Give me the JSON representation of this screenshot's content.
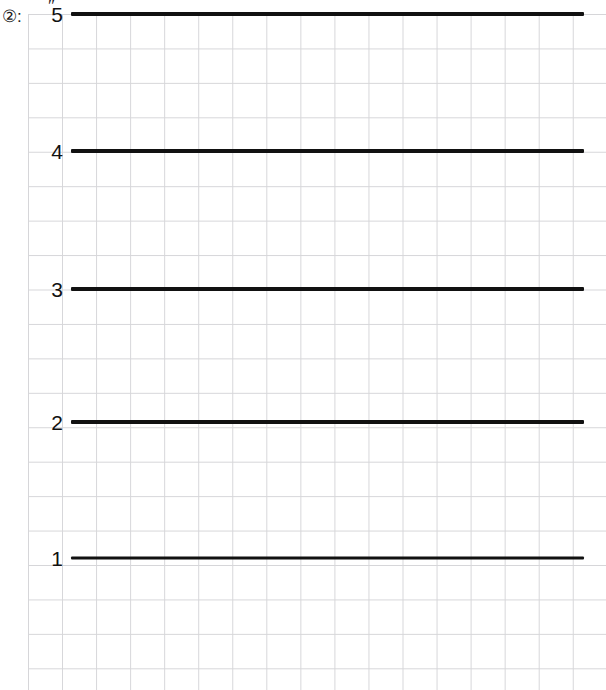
{
  "figure": {
    "kind": "ruled-graph-paper-worksheet",
    "background_color": "#ffffff",
    "grid_color": "#d6d6d9",
    "stroke_color": "#111111",
    "grid_cell_px": 34
  },
  "item_label": {
    "text": "②:",
    "marker": "circled-two",
    "colon": ":"
  },
  "top_mark": {
    "glyph": "″",
    "name": "double-prime-tick"
  },
  "chart_data": {
    "type": "bar",
    "orientation": "horizontal",
    "title": "",
    "subtitle": "",
    "xlabel": "",
    "ylabel": "",
    "grid": true,
    "legend_position": "none",
    "categories": [
      "5",
      "4",
      "3",
      "2",
      "1"
    ],
    "tick_labels": [
      "5",
      "4",
      "3",
      "2",
      "1"
    ],
    "values": [
      513,
      513,
      513,
      513,
      513
    ],
    "xlim": [
      0,
      578
    ],
    "ylim": [
      0,
      690
    ],
    "annotations": [
      "″"
    ],
    "series": [
      {
        "name": "hand-drawn-horizontal-strokes",
        "values": [
          513,
          513,
          513,
          513,
          513
        ]
      }
    ],
    "rows": [
      {
        "label": "5",
        "y_px": 14,
        "x_start_px": 71,
        "x_end_px": 584,
        "thickness_px": 4
      },
      {
        "label": "4",
        "y_px": 151,
        "x_start_px": 71,
        "x_end_px": 584,
        "thickness_px": 4
      },
      {
        "label": "3",
        "y_px": 289,
        "x_start_px": 71,
        "x_end_px": 584,
        "thickness_px": 4
      },
      {
        "label": "2",
        "y_px": 422,
        "x_start_px": 71,
        "x_end_px": 584,
        "thickness_px": 4
      },
      {
        "label": "1",
        "y_px": 558,
        "x_start_px": 71,
        "x_end_px": 584,
        "thickness_px": 3
      }
    ]
  }
}
